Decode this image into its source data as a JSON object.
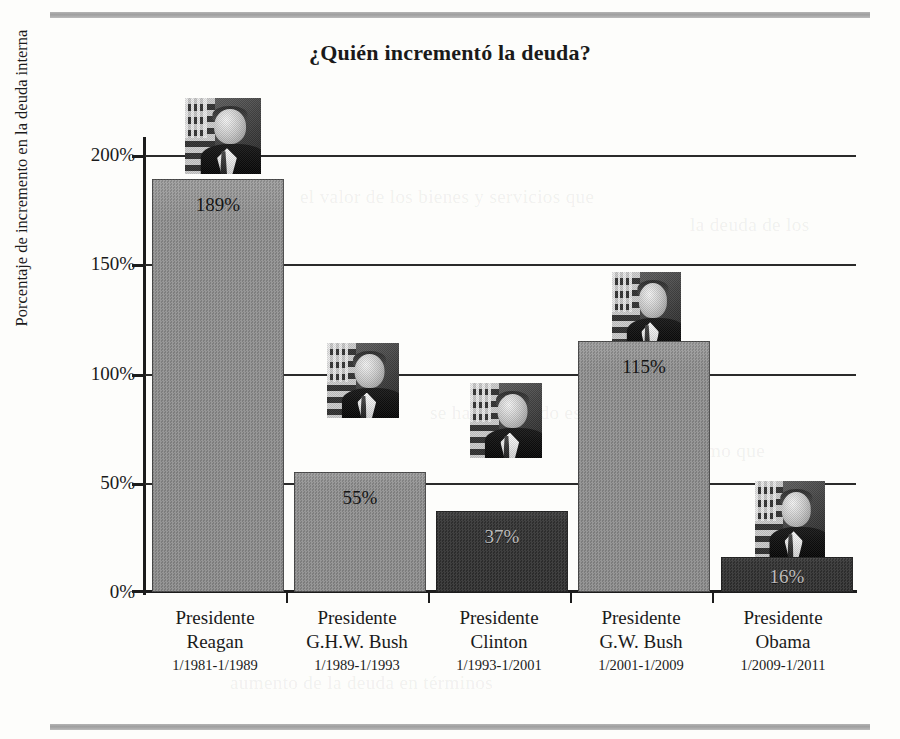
{
  "title": "¿Quién incrementó la deuda?",
  "rules": {
    "top": "horizontal-rule",
    "bottom": "horizontal-rule"
  },
  "ghost_text": [
    "el valor de los bienes y servicios que",
    "la deuda de los",
    "se ha mantenido estable en",
    "no es lo mismo que",
    "aumento de la deuda en términos"
  ],
  "chart_data": {
    "type": "bar",
    "title": "¿Quién incrementó la deuda?",
    "xlabel": "",
    "ylabel": "Porcentaje de incremento en la deuda interna",
    "ylim": [
      0,
      200
    ],
    "yticks": [
      0,
      50,
      100,
      150,
      200
    ],
    "ytick_labels": [
      "0%",
      "50%",
      "100%",
      "150%",
      "200%"
    ],
    "grid": true,
    "legend": "none",
    "categories": [
      "Presidente Reagan",
      "Presidente G.H.W. Bush",
      "Presidente Clinton",
      "Presidente G.W. Bush",
      "Presidente Obama"
    ],
    "values": [
      189,
      55,
      37,
      115,
      16
    ],
    "value_labels": [
      "189%",
      "55%",
      "37%",
      "115%",
      "16%"
    ],
    "bars": [
      {
        "name_line1": "Presidente",
        "name_line2": "Reagan",
        "range": "1/1981-1/1989",
        "value": 189,
        "value_label": "189%",
        "shade": "light",
        "portrait": "reagan-portrait"
      },
      {
        "name_line1": "Presidente",
        "name_line2": "G.H.W. Bush",
        "range": "1/1989-1/1993",
        "value": 55,
        "value_label": "55%",
        "shade": "light",
        "portrait": "ghw-bush-portrait"
      },
      {
        "name_line1": "Presidente",
        "name_line2": "Clinton",
        "range": "1/1993-1/2001",
        "value": 37,
        "value_label": "37%",
        "shade": "dark",
        "portrait": "clinton-portrait"
      },
      {
        "name_line1": "Presidente",
        "name_line2": "G.W. Bush",
        "range": "1/2001-1/2009",
        "value": 115,
        "value_label": "115%",
        "shade": "light",
        "portrait": "gw-bush-portrait"
      },
      {
        "name_line1": "Presidente",
        "name_line2": "Obama",
        "range": "1/2009-1/2011",
        "value": 16,
        "value_label": "16%",
        "shade": "dark",
        "portrait": "obama-portrait"
      }
    ],
    "colors": {
      "bar_light": "#8d8d8d",
      "bar_dark": "#343434",
      "axis": "#1c1c1c",
      "grid": "#2a2a2a",
      "rule": "#a8a8a8",
      "text": "#1a1a1a",
      "page": "#fdfdfb"
    }
  }
}
